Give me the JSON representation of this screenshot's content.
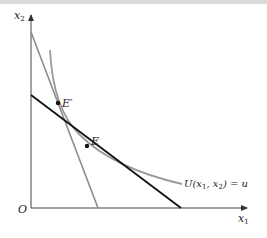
{
  "diagram": {
    "type": "indifference-curve-budget-lines",
    "axes": {
      "y_label": "x",
      "y_label_sub": "2",
      "x_label": "x",
      "x_label_sub": "1",
      "origin_label": "O"
    },
    "curve": {
      "label_prefix": "U(x",
      "label_sub1": "1",
      "label_mid": ",  x",
      "label_sub2": "2",
      "label_suffix": ") = u",
      "color": "#9a9a9a"
    },
    "points": [
      {
        "label": "E′",
        "role": "tangency-steep-line"
      },
      {
        "label": "E",
        "role": "tangency-budget-line"
      }
    ],
    "lines": [
      {
        "name": "steep-budget-line",
        "color": "#8c8c8c"
      },
      {
        "name": "budget-line",
        "color": "#111111"
      }
    ]
  }
}
